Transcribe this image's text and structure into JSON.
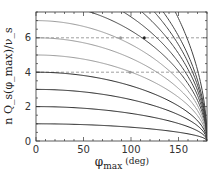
{
  "chart_data": {
    "type": "line",
    "title": "",
    "xlabel": "φ_max (deg)",
    "xlabel_main": "φ",
    "xlabel_sub": "max",
    "xlabel_unit": "(deg)",
    "ylabel": "n Q_s(φ_max)/ν_s",
    "xlim": [
      0,
      180
    ],
    "ylim": [
      0,
      7.5
    ],
    "xticks": [
      0,
      50,
      100,
      150
    ],
    "yticks": [
      0,
      2,
      4,
      6
    ],
    "xminor_step": 10,
    "yminor_step": 0.5,
    "grid": false,
    "legend": null,
    "function_note": "curves approximated as n * ((1+cos φ)/2)^0.25, all converging to 0 at 180°",
    "series": [
      {
        "name": "n=1",
        "start": 1,
        "color": "#222222"
      },
      {
        "name": "n=2",
        "start": 2,
        "color": "#222222"
      },
      {
        "name": "n=3",
        "start": 3,
        "color": "#222222"
      },
      {
        "name": "n=4",
        "start": 4,
        "color": "#222222"
      },
      {
        "name": "n=5",
        "start": 5,
        "color": "#999999"
      },
      {
        "name": "n=6",
        "start": 6,
        "color": "#999999"
      },
      {
        "name": "n=7",
        "start": 7,
        "color": "#999999"
      },
      {
        "name": "n=8",
        "start": 8,
        "color": "#444444"
      },
      {
        "name": "n=9",
        "start": 9,
        "color": "#444444"
      },
      {
        "name": "n=10",
        "start": 10,
        "color": "#444444"
      },
      {
        "name": "n=11",
        "start": 11,
        "color": "#444444"
      },
      {
        "name": "n=12",
        "start": 12,
        "color": "#444444"
      },
      {
        "name": "n=14",
        "start": 14,
        "color": "#444444"
      }
    ],
    "reference_lines": [
      {
        "y": 4,
        "style": "dashed",
        "color": "#888888"
      },
      {
        "y": 6,
        "style": "dashed",
        "color": "#888888"
      }
    ],
    "markers": [
      {
        "x": 89,
        "y": 6,
        "color": "#999999",
        "shape": "dot"
      },
      {
        "x": 114,
        "y": 6,
        "color": "#222222",
        "shape": "dot"
      },
      {
        "x": 99,
        "y": 4,
        "color": "#999999",
        "shape": "dot"
      }
    ]
  }
}
